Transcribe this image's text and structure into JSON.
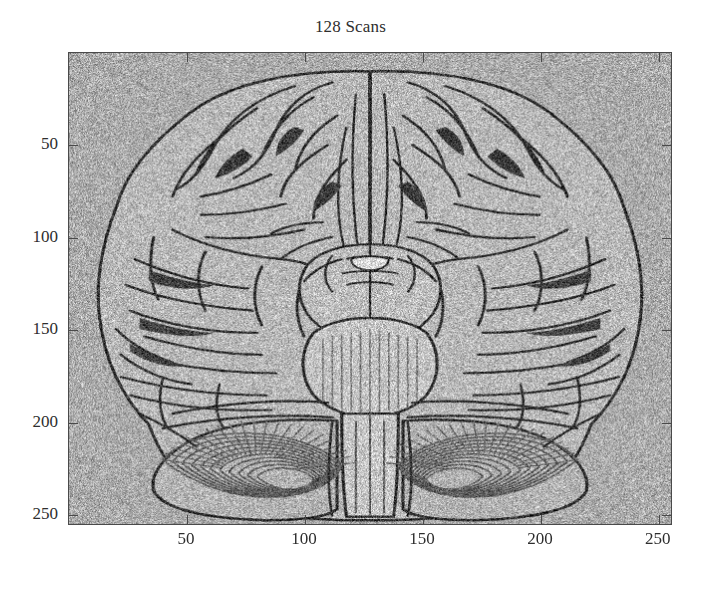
{
  "figure": {
    "title": "128 Scans",
    "background_color": "#ffffff",
    "axis_color": "#4a4a4a",
    "text_color": "#2e2e2e"
  },
  "chart_data": {
    "type": "heatmap",
    "title": "128 Scans",
    "xlabel": "",
    "ylabel": "",
    "xlim": [
      0,
      256
    ],
    "ylim": [
      256,
      0
    ],
    "y_axis_inverted": true,
    "xticks": [
      50,
      100,
      150,
      200,
      250
    ],
    "xticklabels": [
      "50",
      "100",
      "150",
      "200",
      "250"
    ],
    "yticks": [
      50,
      100,
      150,
      200,
      250
    ],
    "yticklabels": [
      "50",
      "100",
      "150",
      "200",
      "250"
    ],
    "grid": false,
    "legend": null,
    "colormap": "gray",
    "image_size": [
      256,
      256
    ],
    "background_intensity": 0.67,
    "brain_tissue_intensity": 0.72,
    "outline_intensity": 0.18,
    "noise_level": 0.09
  },
  "axes": {
    "x_ticks": [
      {
        "value": 50,
        "label": "50"
      },
      {
        "value": 100,
        "label": "100"
      },
      {
        "value": 150,
        "label": "150"
      },
      {
        "value": 200,
        "label": "200"
      },
      {
        "value": 250,
        "label": "250"
      }
    ],
    "y_ticks": [
      {
        "value": 50,
        "label": "50"
      },
      {
        "value": 100,
        "label": "100"
      },
      {
        "value": 150,
        "label": "150"
      },
      {
        "value": 200,
        "label": "200"
      },
      {
        "value": 250,
        "label": "250"
      }
    ]
  }
}
